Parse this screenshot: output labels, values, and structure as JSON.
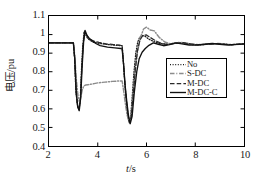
{
  "chart_data": {
    "type": "line",
    "title": "",
    "xlabel": "t/s",
    "ylabel": "电压/pu",
    "xlim": [
      2,
      10
    ],
    "ylim": [
      0.4,
      1.1
    ],
    "xticks": [
      "2",
      "4",
      "6",
      "8",
      "10"
    ],
    "xtick_values": [
      2,
      4,
      6,
      8,
      10
    ],
    "yticks": [
      "0.4",
      "0.5",
      "0.6",
      "0.7",
      "0.8",
      "0.9",
      "1",
      "1.1"
    ],
    "ytick_values": [
      0.4,
      0.5,
      0.6,
      0.7,
      0.8,
      0.9,
      1.0,
      1.1
    ],
    "grid": false,
    "legend_position": "lower-right-inside",
    "series": [
      {
        "name": "No",
        "style": "dotted",
        "color": "#1a1a1a",
        "x": [
          2.0,
          2.6,
          3.0,
          3.05,
          3.1,
          3.16,
          3.22,
          3.28,
          3.32,
          3.38,
          3.44,
          3.5,
          3.56,
          3.62,
          3.7,
          3.8,
          3.95,
          4.2,
          4.5,
          4.8,
          5.0,
          5.05,
          5.1,
          5.16,
          5.22,
          5.28,
          5.34,
          5.4,
          5.48,
          5.56,
          5.64,
          5.72,
          5.82,
          5.95,
          6.1,
          6.3,
          6.55,
          6.8,
          7.05,
          7.3,
          7.6,
          7.9,
          8.2,
          8.5,
          8.8,
          9.1,
          9.4,
          9.7,
          10.0
        ],
        "y": [
          0.955,
          0.955,
          0.955,
          0.88,
          0.7,
          0.625,
          0.6,
          0.64,
          0.78,
          0.93,
          1.015,
          1.0,
          0.985,
          0.975,
          0.968,
          0.96,
          0.955,
          0.95,
          0.945,
          0.942,
          0.94,
          0.86,
          0.76,
          0.66,
          0.575,
          0.53,
          0.545,
          0.64,
          0.79,
          0.9,
          0.96,
          0.985,
          0.995,
          0.99,
          0.975,
          0.962,
          0.952,
          0.948,
          0.952,
          0.956,
          0.952,
          0.946,
          0.944,
          0.948,
          0.952,
          0.95,
          0.946,
          0.947,
          0.95
        ]
      },
      {
        "name": "S-DC",
        "style": "dashdot",
        "color": "#8c8c8c",
        "x": [
          2.0,
          2.6,
          3.0,
          3.06,
          3.12,
          3.18,
          3.24,
          3.3,
          3.36,
          3.42,
          3.5,
          3.6,
          3.7,
          3.85,
          4.0,
          4.3,
          4.6,
          4.85,
          5.0,
          5.06,
          5.12,
          5.2,
          5.28,
          5.36,
          5.44,
          5.52,
          5.62,
          5.74,
          5.88,
          6.0,
          6.15,
          6.32,
          6.52,
          6.75,
          7.0,
          7.3,
          7.6,
          7.9,
          8.25,
          8.6,
          8.95,
          9.3,
          9.65,
          10.0
        ],
        "y": [
          0.955,
          0.955,
          0.955,
          0.88,
          0.76,
          0.68,
          0.64,
          0.66,
          0.7,
          0.722,
          0.728,
          0.73,
          0.732,
          0.736,
          0.74,
          0.744,
          0.748,
          0.75,
          0.75,
          0.7,
          0.64,
          0.57,
          0.53,
          0.56,
          0.66,
          0.79,
          0.9,
          0.98,
          1.03,
          1.04,
          1.025,
          1.02,
          0.985,
          0.96,
          0.95,
          0.958,
          0.955,
          0.948,
          0.946,
          0.95,
          0.952,
          0.948,
          0.946,
          0.949
        ]
      },
      {
        "name": "M-DC",
        "style": "dashed",
        "color": "#2a2a2a",
        "x": [
          2.0,
          2.6,
          3.0,
          3.05,
          3.11,
          3.17,
          3.23,
          3.29,
          3.34,
          3.4,
          3.46,
          3.54,
          3.62,
          3.72,
          3.86,
          4.05,
          4.35,
          4.65,
          4.9,
          5.0,
          5.05,
          5.11,
          5.17,
          5.24,
          5.3,
          5.37,
          5.45,
          5.54,
          5.63,
          5.73,
          5.85,
          6.0,
          6.18,
          6.4,
          6.65,
          6.9,
          7.2,
          7.5,
          7.8,
          8.1,
          8.45,
          8.8,
          9.15,
          9.5,
          9.8,
          10.0
        ],
        "y": [
          0.955,
          0.955,
          0.955,
          0.87,
          0.69,
          0.615,
          0.595,
          0.65,
          0.8,
          0.945,
          1.018,
          0.998,
          0.982,
          0.972,
          0.964,
          0.958,
          0.95,
          0.946,
          0.943,
          0.94,
          0.855,
          0.745,
          0.65,
          0.57,
          0.525,
          0.555,
          0.665,
          0.81,
          0.915,
          0.97,
          0.995,
          0.998,
          0.982,
          0.965,
          0.95,
          0.947,
          0.953,
          0.956,
          0.95,
          0.945,
          0.947,
          0.951,
          0.949,
          0.945,
          0.948,
          0.95
        ]
      },
      {
        "name": "M-DC-C",
        "style": "solid",
        "color": "#111111",
        "x": [
          2.0,
          2.6,
          3.0,
          3.06,
          3.12,
          3.18,
          3.24,
          3.3,
          3.36,
          3.42,
          3.48,
          3.56,
          3.66,
          3.78,
          3.92,
          4.1,
          4.4,
          4.7,
          4.95,
          5.0,
          5.06,
          5.12,
          5.19,
          5.26,
          5.33,
          5.41,
          5.5,
          5.6,
          5.7,
          5.82,
          5.95,
          6.1,
          6.28,
          6.48,
          6.7,
          6.95,
          7.2,
          7.45,
          7.75,
          8.05,
          8.35,
          8.7,
          9.0,
          9.35,
          9.7,
          10.0
        ],
        "y": [
          0.955,
          0.955,
          0.955,
          0.865,
          0.69,
          0.61,
          0.59,
          0.66,
          0.83,
          0.96,
          1.022,
          0.995,
          0.978,
          0.966,
          0.952,
          0.94,
          0.932,
          0.928,
          0.925,
          0.922,
          0.84,
          0.73,
          0.64,
          0.565,
          0.52,
          0.56,
          0.69,
          0.8,
          0.87,
          0.905,
          0.925,
          0.942,
          0.955,
          0.948,
          0.94,
          0.946,
          0.955,
          0.95,
          0.944,
          0.943,
          0.948,
          0.952,
          0.948,
          0.944,
          0.947,
          0.949
        ]
      }
    ]
  },
  "axes": {
    "ylabel": "电压/pu",
    "xlabel_italic": "t",
    "xlabel_rest": "/s"
  },
  "legend": {
    "items": [
      {
        "label": "No"
      },
      {
        "label": "S-DC"
      },
      {
        "label": "M-DC"
      },
      {
        "label": "M-DC-C"
      }
    ]
  }
}
